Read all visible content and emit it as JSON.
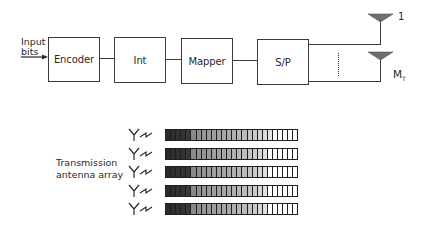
{
  "diagram": {
    "input_label_line1": "Input",
    "input_label_line2": "bits",
    "blocks": [
      {
        "id": "encoder",
        "label": "Encoder"
      },
      {
        "id": "interleaver",
        "label": "Int"
      },
      {
        "id": "mapper",
        "label": "Mapper"
      },
      {
        "id": "serial-to-parallel",
        "label": "S/P"
      }
    ],
    "antennas": [
      {
        "label": "1",
        "label_sub": ""
      },
      {
        "label": "M",
        "label_sub": "T"
      }
    ],
    "array_label_line1": "Transmission",
    "array_label_line2": "antenna array",
    "colors": {
      "line": "#3a3a3a",
      "antenna_fill": "#6e6e6e",
      "bar_outline": "#1e1e1e"
    },
    "bar_rows": [
      {
        "shades": [
          "#2a2a2a",
          "#2e2e2e",
          "#303030",
          "#333333",
          "#383838",
          "#8a8a8a",
          "#909090",
          "#959595",
          "#9a9a9a",
          "#9e9e9e",
          "#a2a2a2",
          "#a6a6a6",
          "#aaaaaa",
          "#b0b0b0",
          "#b6b6b6",
          "#bcbcbc",
          "#c4c4c4",
          "#cccccc",
          "#d4d4d4",
          "#dcdcdc",
          "#e4e4e4",
          "#ffffff",
          "#ffffff",
          "#ffffff",
          "#ffffff",
          "#ffffff"
        ]
      },
      {
        "shades": [
          "#2a2a2a",
          "#2e2e2e",
          "#303030",
          "#333333",
          "#383838",
          "#8a8a8a",
          "#909090",
          "#959595",
          "#9a9a9a",
          "#9e9e9e",
          "#a2a2a2",
          "#a6a6a6",
          "#aaaaaa",
          "#b0b0b0",
          "#b6b6b6",
          "#bcbcbc",
          "#c4c4c4",
          "#cccccc",
          "#d6d6d6",
          "#e0e0e0",
          "#ffffff",
          "#ffffff",
          "#ffffff",
          "#ffffff",
          "#ffffff",
          "#ffffff"
        ]
      },
      {
        "shades": [
          "#2a2a2a",
          "#2e2e2e",
          "#303030",
          "#333333",
          "#383838",
          "#8a8a8a",
          "#909090",
          "#959595",
          "#9a9a9a",
          "#9e9e9e",
          "#a2a2a2",
          "#a6a6a6",
          "#aaaaaa",
          "#b0b0b0",
          "#b6b6b6",
          "#bcbcbc",
          "#c4c4c4",
          "#cccccc",
          "#d6d6d6",
          "#e0e0e0",
          "#ffffff",
          "#ffffff",
          "#ffffff",
          "#ffffff",
          "#ffffff",
          "#ffffff"
        ]
      },
      {
        "shades": [
          "#2a2a2a",
          "#2e2e2e",
          "#303030",
          "#333333",
          "#383838",
          "#8a8a8a",
          "#909090",
          "#959595",
          "#9a9a9a",
          "#9e9e9e",
          "#a2a2a2",
          "#a6a6a6",
          "#aaaaaa",
          "#b0b0b0",
          "#b6b6b6",
          "#bcbcbc",
          "#c4c4c4",
          "#cccccc",
          "#d6d6d6",
          "#e0e0e0",
          "#ffffff",
          "#ffffff",
          "#ffffff",
          "#ffffff",
          "#ffffff",
          "#ffffff"
        ]
      },
      {
        "shades": [
          "#2a2a2a",
          "#2e2e2e",
          "#303030",
          "#333333",
          "#383838",
          "#8a8a8a",
          "#909090",
          "#959595",
          "#9a9a9a",
          "#9e9e9e",
          "#a2a2a2",
          "#a6a6a6",
          "#aaaaaa",
          "#b0b0b0",
          "#b6b6b6",
          "#bcbcbc",
          "#c4c4c4",
          "#cccccc",
          "#d6d6d6",
          "#e0e0e0",
          "#ffffff",
          "#ffffff",
          "#ffffff",
          "#ffffff",
          "#ffffff",
          "#ffffff"
        ]
      }
    ]
  }
}
